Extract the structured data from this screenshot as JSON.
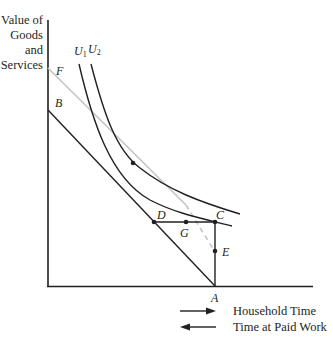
{
  "diagram": {
    "y_axis_label": [
      "Value of",
      "Goods",
      "and",
      "Services"
    ],
    "curves": {
      "u1": {
        "base": "U",
        "sub": "1"
      },
      "u2": {
        "base": "U",
        "sub": "2"
      }
    },
    "points": {
      "F": "F",
      "B": "B",
      "C": "C",
      "D": "D",
      "G": "G",
      "E": "E",
      "A": "A"
    },
    "legend": {
      "right_arrow_label": "Household Time",
      "left_arrow_label": "Time at Paid Work"
    },
    "colors": {
      "ink": "#231f20",
      "gray_line": "#bdbdbd"
    }
  }
}
